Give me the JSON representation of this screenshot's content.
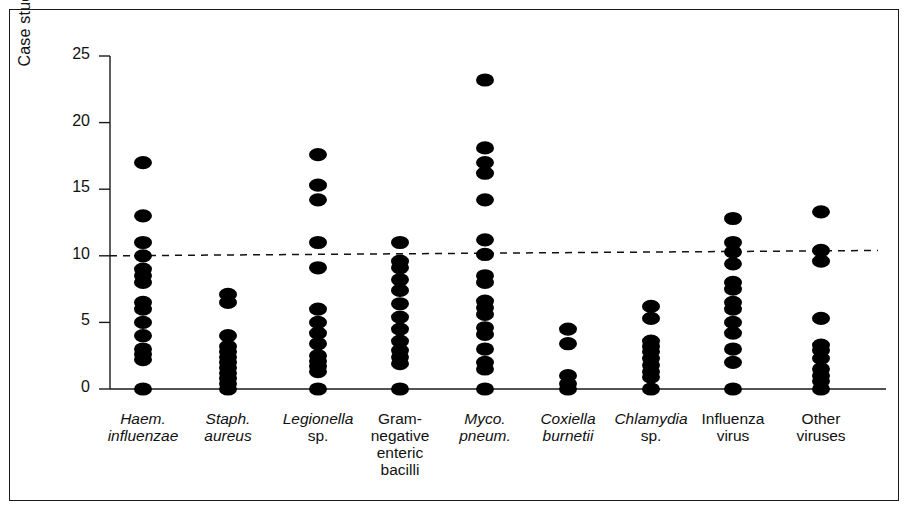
{
  "chart": {
    "type": "scatter",
    "title": "",
    "ylabel": "Case studies (%)",
    "xlabel": "",
    "ylim": [
      0,
      25
    ],
    "yticks": [
      0,
      5,
      10,
      15,
      20,
      25
    ],
    "ytick_labels": [
      "0",
      "5",
      "10",
      "15",
      "20",
      "25"
    ],
    "grid": false,
    "legend": null,
    "reference_line": {
      "style": "dashed",
      "value": 10,
      "label": "",
      "y_left": 10.0,
      "y_right": 10.4
    },
    "marker": "filled-circle",
    "marker_color": "#000000",
    "categories": [
      "Haem. influenzae",
      "Staph. aureus",
      "Legionella sp.",
      "Gram-negative enteric bacilli",
      "Myco. pneum.",
      "Coxiella burnetii",
      "Chlamydia sp.",
      "Influenza virus",
      "Other viruses"
    ],
    "category_labels": [
      {
        "italic": "Haem.",
        "roman": "",
        "lines": [
          "Haem.",
          "influenzae"
        ],
        "italic_lines": [
          true,
          true
        ]
      },
      {
        "italic": "Staph.",
        "roman": "",
        "lines": [
          "Staph.",
          "aureus"
        ],
        "italic_lines": [
          true,
          true
        ]
      },
      {
        "italic": "Legionella",
        "roman": "sp.",
        "lines": [
          "Legionella",
          "sp."
        ],
        "italic_lines": [
          true,
          false
        ]
      },
      {
        "italic": "",
        "roman": "Gram-negative enteric bacilli",
        "lines": [
          "Gram-",
          "negative",
          "enteric",
          "bacilli"
        ],
        "italic_lines": [
          false,
          false,
          false,
          false
        ]
      },
      {
        "italic": "Myco. pneum.",
        "roman": "",
        "lines": [
          "Myco.",
          "pneum."
        ],
        "italic_lines": [
          true,
          true
        ]
      },
      {
        "italic": "Coxiella burnetii",
        "roman": "",
        "lines": [
          "Coxiella",
          "burnetii"
        ],
        "italic_lines": [
          true,
          true
        ]
      },
      {
        "italic": "Chlamydia",
        "roman": "sp.",
        "lines": [
          "Chlamydia",
          "sp."
        ],
        "italic_lines": [
          true,
          false
        ]
      },
      {
        "italic": "",
        "roman": "Influenza virus",
        "lines": [
          "Influenza",
          "virus"
        ],
        "italic_lines": [
          false,
          false
        ]
      },
      {
        "italic": "",
        "roman": "Other viruses",
        "lines": [
          "Other",
          "viruses"
        ],
        "italic_lines": [
          false,
          false
        ]
      }
    ],
    "series": [
      {
        "name": "Haem. influenzae",
        "values": [
          17.0,
          13.0,
          11.0,
          10.0,
          9.0,
          8.5,
          8.0,
          6.5,
          6.0,
          5.0,
          4.0,
          3.0,
          2.6,
          2.2,
          0.0
        ]
      },
      {
        "name": "Staph. aureus",
        "values": [
          7.1,
          6.5,
          4.0,
          3.2,
          2.8,
          2.4,
          2.0,
          1.6,
          1.2,
          0.8,
          0.4,
          0.0
        ]
      },
      {
        "name": "Legionella sp.",
        "values": [
          17.6,
          15.3,
          14.2,
          11.0,
          9.1,
          6.0,
          5.0,
          4.2,
          3.4,
          2.5,
          2.1,
          1.7,
          1.3,
          0.0
        ]
      },
      {
        "name": "Gram-negative enteric bacilli",
        "values": [
          11.0,
          9.6,
          9.1,
          8.2,
          7.4,
          6.4,
          5.4,
          4.5,
          3.6,
          2.9,
          2.4,
          1.9,
          0.0
        ]
      },
      {
        "name": "Myco. pneum.",
        "values": [
          23.2,
          18.1,
          17.0,
          16.2,
          14.2,
          11.2,
          10.1,
          8.5,
          8.0,
          6.6,
          6.1,
          5.6,
          4.6,
          4.1,
          3.0,
          2.0,
          1.5,
          0.0
        ]
      },
      {
        "name": "Coxiella burnetii",
        "values": [
          4.5,
          3.4,
          1.0,
          0.4,
          0.0
        ]
      },
      {
        "name": "Chlamydia sp.",
        "values": [
          6.2,
          5.3,
          3.6,
          3.2,
          2.8,
          2.3,
          1.8,
          1.3,
          0.9,
          0.0
        ]
      },
      {
        "name": "Influenza virus",
        "values": [
          12.8,
          11.0,
          10.3,
          9.4,
          8.0,
          7.5,
          6.5,
          6.0,
          5.0,
          4.2,
          3.0,
          2.0,
          0.0
        ]
      },
      {
        "name": "Other viruses",
        "values": [
          13.3,
          10.4,
          9.6,
          5.3,
          3.3,
          2.9,
          2.3,
          1.5,
          1.0,
          0.6,
          0.0
        ]
      }
    ]
  }
}
